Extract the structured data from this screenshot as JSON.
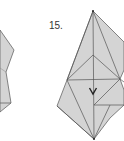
{
  "diagram": {
    "type": "origami-fold-step",
    "step_label": "15.",
    "colors": {
      "paper_fill": "#d4d4d4",
      "crease_line": "#555555",
      "background": "#ffffff",
      "label": "#333333"
    },
    "arrow": {
      "direction": "down",
      "meaning": "fold-down"
    }
  }
}
